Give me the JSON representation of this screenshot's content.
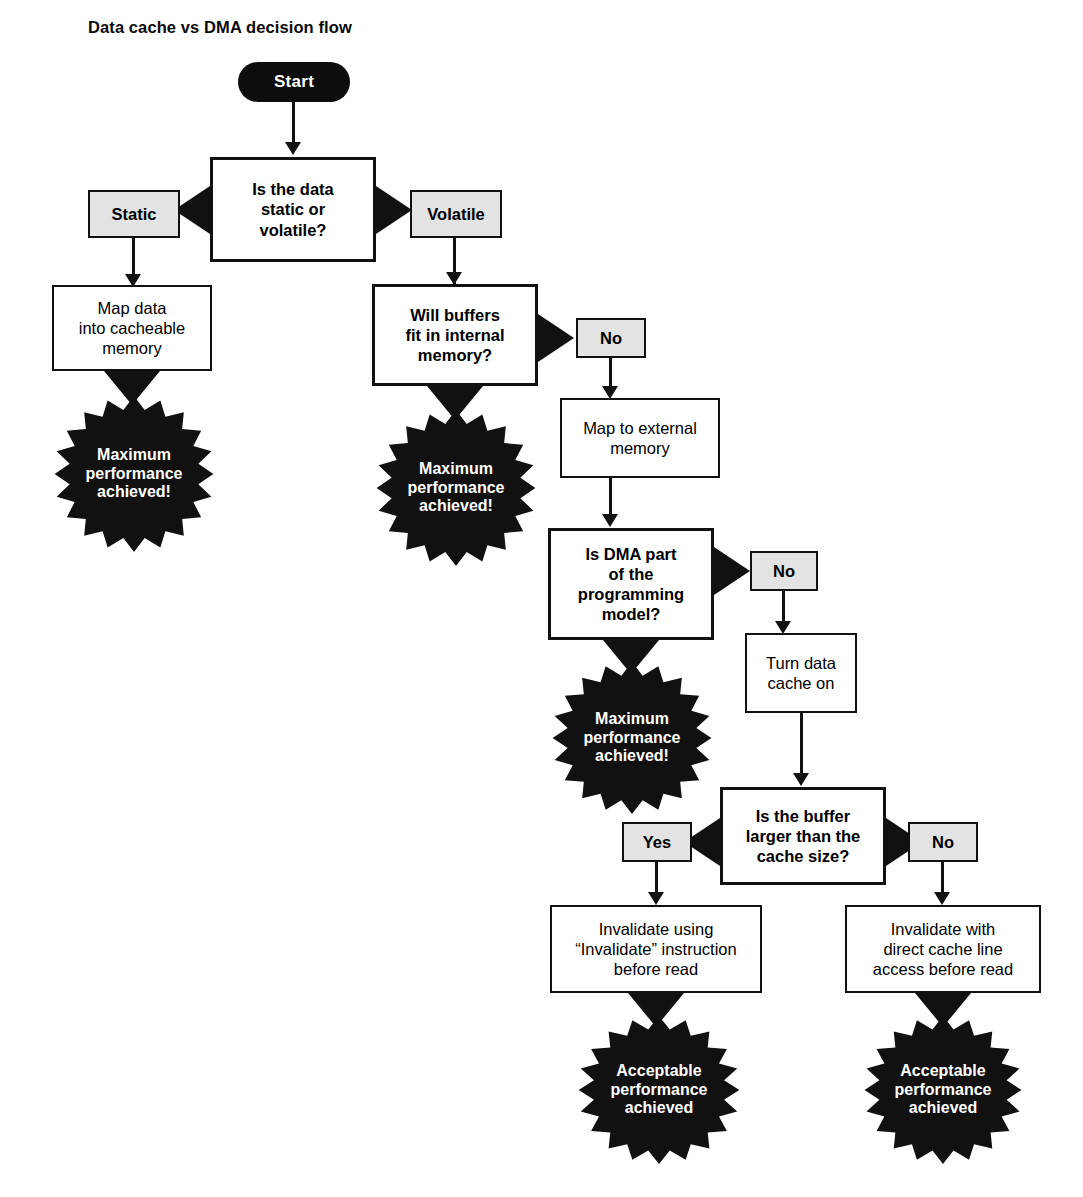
{
  "title": "Data cache vs DMA decision flow",
  "nodes": {
    "start": "Start",
    "q_static": "Is the data\nstatic or\nvolatile?",
    "chip_static": "Static",
    "chip_volatile": "Volatile",
    "map_cacheable": "Map data\ninto cacheable\nmemory",
    "burst_left": "Maximum\nperformance\nachieved!",
    "q_buffers": "Will buffers\nfit in internal\nmemory?",
    "chip_no_buffers": "No",
    "burst_buffers": "Maximum\nperformance\nachieved!",
    "map_external": "Map to external\nmemory",
    "q_dma": "Is DMA part\nof the\nprogramming\nmodel?",
    "chip_no_dma": "No",
    "burst_dma": "Maximum\nperformance\nachieved!",
    "turn_cache_on": "Turn data\ncache on",
    "q_buffer_size": "Is the buffer\nlarger than the\ncache size?",
    "chip_yes_size": "Yes",
    "chip_no_size": "No",
    "invalidate_instruction": "Invalidate using\n“Invalidate” instruction\nbefore read",
    "invalidate_direct": "Invalidate with\ndirect cache line\naccess before read",
    "burst_acceptable_left": "Acceptable\nperformance\nachieved",
    "burst_acceptable_right": "Acceptable\nperformance\nachieved"
  },
  "colors": {
    "ink": "#111111",
    "paper": "#ffffff",
    "chip_fill": "#e3e3e3",
    "terminator_fill": "#0d0d0d",
    "terminator_text": "#ffffff"
  },
  "flow": {
    "type": "flowchart",
    "edges": [
      {
        "from": "start",
        "to": "q_static",
        "label": ""
      },
      {
        "from": "q_static",
        "to": "chip_static",
        "label": "Static"
      },
      {
        "from": "q_static",
        "to": "chip_volatile",
        "label": "Volatile"
      },
      {
        "from": "chip_static",
        "to": "map_cacheable",
        "label": ""
      },
      {
        "from": "map_cacheable",
        "to": "burst_left",
        "label": ""
      },
      {
        "from": "chip_volatile",
        "to": "q_buffers",
        "label": ""
      },
      {
        "from": "q_buffers",
        "to": "burst_buffers",
        "label": "Yes"
      },
      {
        "from": "q_buffers",
        "to": "chip_no_buffers",
        "label": "No"
      },
      {
        "from": "chip_no_buffers",
        "to": "map_external",
        "label": ""
      },
      {
        "from": "map_external",
        "to": "q_dma",
        "label": ""
      },
      {
        "from": "q_dma",
        "to": "burst_dma",
        "label": "Yes"
      },
      {
        "from": "q_dma",
        "to": "chip_no_dma",
        "label": "No"
      },
      {
        "from": "chip_no_dma",
        "to": "turn_cache_on",
        "label": ""
      },
      {
        "from": "turn_cache_on",
        "to": "q_buffer_size",
        "label": ""
      },
      {
        "from": "q_buffer_size",
        "to": "chip_yes_size",
        "label": "Yes"
      },
      {
        "from": "q_buffer_size",
        "to": "chip_no_size",
        "label": "No"
      },
      {
        "from": "chip_yes_size",
        "to": "invalidate_instruction",
        "label": ""
      },
      {
        "from": "chip_no_size",
        "to": "invalidate_direct",
        "label": ""
      },
      {
        "from": "invalidate_instruction",
        "to": "burst_acceptable_left",
        "label": ""
      },
      {
        "from": "invalidate_direct",
        "to": "burst_acceptable_right",
        "label": ""
      }
    ]
  }
}
